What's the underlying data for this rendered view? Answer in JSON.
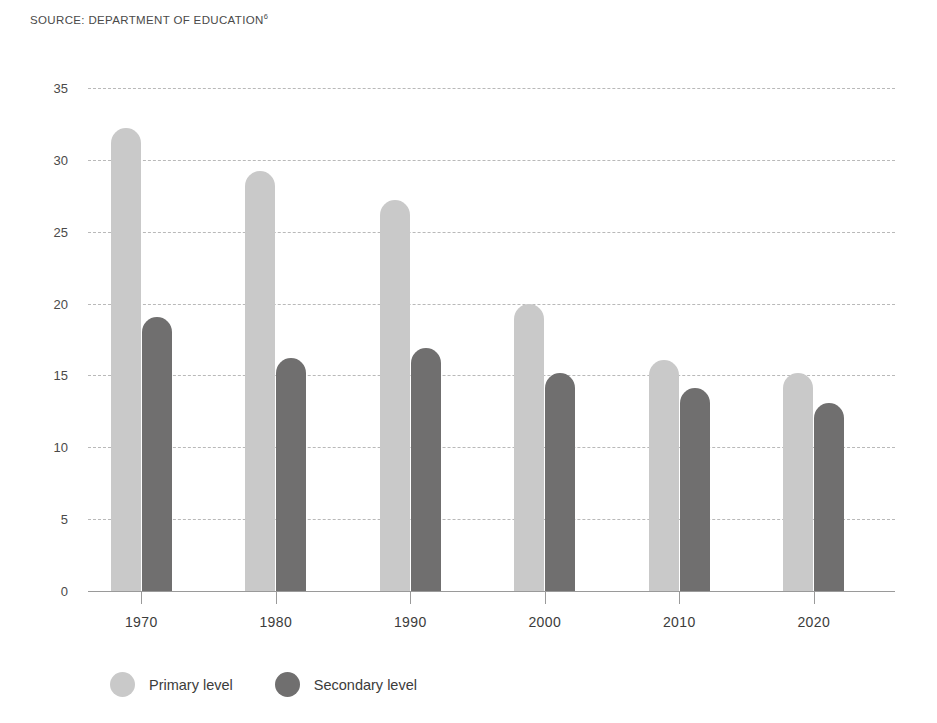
{
  "source": {
    "text": "SOURCE: DEPARTMENT OF EDUCATION",
    "footnote": "6"
  },
  "chart_data": {
    "type": "bar",
    "title": "",
    "subtitle": "",
    "xlabel": "",
    "ylabel": "",
    "categories": [
      "1970",
      "1980",
      "1990",
      "2000",
      "2010",
      "2020"
    ],
    "series": [
      {
        "name": "Primary level",
        "color": "#c9c9c9",
        "values": [
          32.2,
          29.2,
          27.2,
          20.0,
          16.1,
          15.2
        ]
      },
      {
        "name": "Secondary level",
        "color": "#706f6f",
        "values": [
          19.1,
          16.2,
          16.9,
          15.2,
          14.1,
          13.1
        ]
      }
    ],
    "ylim": [
      0,
      35
    ],
    "yticks": [
      0,
      5,
      10,
      15,
      20,
      25,
      30,
      35
    ],
    "ytick_labels": [
      "0",
      "5",
      "10",
      "15",
      "20",
      "25",
      "30",
      "35"
    ],
    "grid": true,
    "grid_style": "dashed",
    "grid_color": "#b9b9b9",
    "legend_position": "bottom-left",
    "axis_color": "#9a9a9a",
    "background": "#ffffff"
  }
}
